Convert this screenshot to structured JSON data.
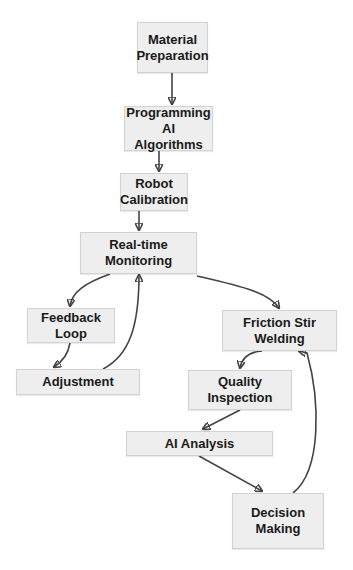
{
  "diagram": {
    "type": "flowchart",
    "nodes": [
      {
        "id": "material_preparation",
        "label": "Material\nPreparation"
      },
      {
        "id": "programming_ai",
        "label": "Programming AI\nAlgorithms"
      },
      {
        "id": "robot_calibration",
        "label": "Robot\nCalibration"
      },
      {
        "id": "realtime_monitoring",
        "label": "Real-time\nMonitoring"
      },
      {
        "id": "feedback_loop",
        "label": "Feedback\nLoop"
      },
      {
        "id": "adjustment",
        "label": "Adjustment"
      },
      {
        "id": "friction_stir_welding",
        "label": "Friction Stir\nWelding"
      },
      {
        "id": "quality_inspection",
        "label": "Quality\nInspection"
      },
      {
        "id": "ai_analysis",
        "label": "AI Analysis"
      },
      {
        "id": "decision_making",
        "label": "Decision\nMaking"
      }
    ],
    "edges": [
      {
        "from": "material_preparation",
        "to": "programming_ai"
      },
      {
        "from": "programming_ai",
        "to": "robot_calibration"
      },
      {
        "from": "robot_calibration",
        "to": "realtime_monitoring"
      },
      {
        "from": "realtime_monitoring",
        "to": "feedback_loop"
      },
      {
        "from": "realtime_monitoring",
        "to": "friction_stir_welding"
      },
      {
        "from": "feedback_loop",
        "to": "adjustment"
      },
      {
        "from": "adjustment",
        "to": "realtime_monitoring"
      },
      {
        "from": "friction_stir_welding",
        "to": "quality_inspection"
      },
      {
        "from": "quality_inspection",
        "to": "ai_analysis"
      },
      {
        "from": "ai_analysis",
        "to": "decision_making"
      },
      {
        "from": "decision_making",
        "to": "friction_stir_welding"
      }
    ],
    "colors": {
      "node_fill": "#eeeeee",
      "node_border": "#d2d2d2",
      "edge": "#444444",
      "text": "#1a1a1a"
    }
  }
}
